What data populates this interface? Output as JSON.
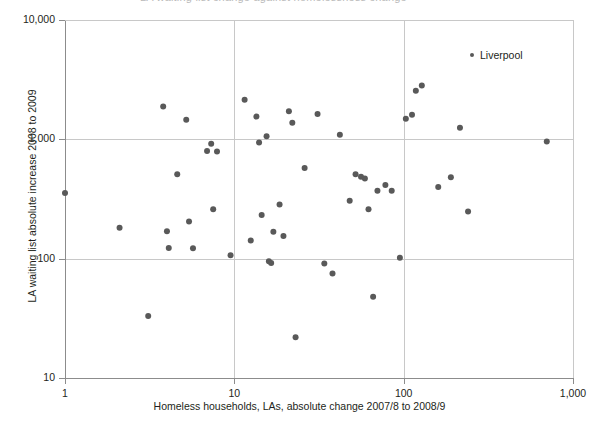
{
  "top_fragment": "LA waiting list change against homelessness change",
  "legend": {
    "marker_icon": "dot-marker-icon",
    "label": "Liverpool"
  },
  "colors": {
    "point": "#595959",
    "axis": "#8c8c8c",
    "grid": "#c8c8c8",
    "text": "#231f20",
    "background": "#ffffff"
  },
  "chart_data": {
    "type": "scatter",
    "title": "",
    "xlabel": "Homeless households, LAs, absolute change 2007/8 to 2008/9",
    "ylabel": "LA waiting list absolute increase 2008 to 2009",
    "xscale": "log",
    "yscale": "log",
    "xlim": [
      1,
      1000
    ],
    "ylim": [
      10,
      10000
    ],
    "xticks": [
      1,
      10,
      100,
      1000
    ],
    "xtick_labels": [
      "1",
      "10",
      "100",
      "1,000"
    ],
    "yticks": [
      10,
      100,
      1000,
      10000
    ],
    "ytick_labels": [
      "10",
      "100",
      "1,000",
      "10,000"
    ],
    "grid": true,
    "grid_axes": "both",
    "legend_position": "top-right",
    "series": [
      {
        "name": "Liverpool",
        "marker": "circle",
        "color": "#595959",
        "points": [
          [
            1.0,
            355
          ],
          [
            2.1,
            182
          ],
          [
            3.1,
            33
          ],
          [
            3.8,
            1880
          ],
          [
            4.0,
            170
          ],
          [
            4.1,
            123
          ],
          [
            4.6,
            510
          ],
          [
            5.2,
            1460
          ],
          [
            5.4,
            205
          ],
          [
            5.7,
            122
          ],
          [
            6.9,
            800
          ],
          [
            7.3,
            920
          ],
          [
            7.5,
            260
          ],
          [
            7.9,
            790
          ],
          [
            9.5,
            107
          ],
          [
            11.5,
            2150
          ],
          [
            12.5,
            142
          ],
          [
            13.5,
            1550
          ],
          [
            14.0,
            940
          ],
          [
            14.5,
            232
          ],
          [
            15.5,
            1060
          ],
          [
            16.0,
            95
          ],
          [
            16.5,
            92
          ],
          [
            17.0,
            168
          ],
          [
            18.5,
            285
          ],
          [
            19.5,
            155
          ],
          [
            21.0,
            1720
          ],
          [
            22.0,
            1380
          ],
          [
            23.0,
            22
          ],
          [
            26.0,
            575
          ],
          [
            31.0,
            1630
          ],
          [
            34.0,
            91
          ],
          [
            38.0,
            75
          ],
          [
            42.0,
            1090
          ],
          [
            48.0,
            305
          ],
          [
            52.0,
            510
          ],
          [
            56.0,
            485
          ],
          [
            59.0,
            470
          ],
          [
            62.0,
            260
          ],
          [
            66.0,
            48
          ],
          [
            70.0,
            370
          ],
          [
            78.0,
            415
          ],
          [
            85.0,
            370
          ],
          [
            95.0,
            102
          ],
          [
            103.0,
            1490
          ],
          [
            112.0,
            1610
          ],
          [
            118.0,
            2550
          ],
          [
            128.0,
            2820
          ],
          [
            160.0,
            398
          ],
          [
            190.0,
            480
          ],
          [
            215.0,
            1250
          ],
          [
            240.0,
            248
          ],
          [
            700.0,
            960
          ]
        ]
      }
    ]
  },
  "geometry": {
    "plot_left": 65,
    "plot_right": 573,
    "plot_top": 20,
    "plot_bottom": 378
  }
}
